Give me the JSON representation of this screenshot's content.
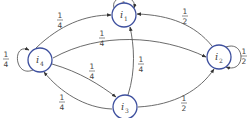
{
  "diagram": {
    "type": "markov-chain",
    "colors": {
      "node_stroke": "#3d4f9e",
      "edge": "#5a5a5a",
      "text": "#444444"
    },
    "nodes": [
      {
        "id": "i1",
        "name": "i",
        "sub": "1"
      },
      {
        "id": "i2",
        "name": "i",
        "sub": "2"
      },
      {
        "id": "i3",
        "name": "i",
        "sub": "3"
      },
      {
        "id": "i4",
        "name": "i",
        "sub": "4"
      }
    ],
    "edges": [
      {
        "from": "i1",
        "to": "i1",
        "label": "1"
      },
      {
        "from": "i2",
        "to": "i2",
        "num": "1",
        "den": "2"
      },
      {
        "from": "i2",
        "to": "i1",
        "num": "1",
        "den": "2"
      },
      {
        "from": "i3",
        "to": "i2",
        "num": "1",
        "den": "2"
      },
      {
        "from": "i3",
        "to": "i1",
        "num": "1",
        "den": "4"
      },
      {
        "from": "i3",
        "to": "i4",
        "num": "1",
        "den": "4"
      },
      {
        "from": "i4",
        "to": "i4",
        "num": "1",
        "den": "4"
      },
      {
        "from": "i4",
        "to": "i1",
        "num": "1",
        "den": "4"
      },
      {
        "from": "i4",
        "to": "i2",
        "num": "1",
        "den": "4"
      },
      {
        "from": "i4",
        "to": "i3",
        "num": "1",
        "den": "4"
      }
    ]
  }
}
